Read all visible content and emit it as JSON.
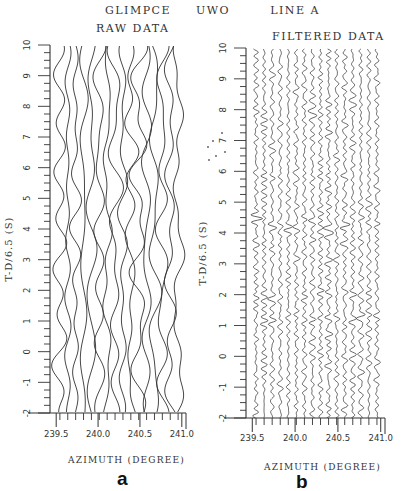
{
  "header": {
    "title_parts": [
      "GLIMPCE",
      "UWO",
      "LINE A"
    ]
  },
  "chart_data": [
    {
      "type": "line",
      "panel": "a",
      "title": "RAW DATA",
      "xlabel": "AZIMUTH (DEGREE)",
      "ylabel": "T-D/6.5 (S)",
      "xlim": [
        239.45,
        241.05
      ],
      "ylim": [
        -2,
        10
      ],
      "x_ticks": [
        239.5,
        240.0,
        240.5,
        241.0
      ],
      "x_tick_labels": [
        "239.5",
        "240.0",
        "240.5",
        "241.0"
      ],
      "y_ticks": [
        -2,
        -1,
        0,
        1,
        2,
        3,
        4,
        5,
        6,
        7,
        8,
        9,
        10
      ],
      "y_tick_labels": [
        "-2",
        "-1",
        "0",
        "1",
        "2",
        "3",
        "4",
        "5",
        "6",
        "7",
        "8",
        "9",
        "10"
      ],
      "y_minor_step": 0.25,
      "grid": false,
      "trace_count": 16,
      "trace_character": "low-frequency wavy seismic traces, large lateral swings, no coherent arrivals"
    },
    {
      "type": "line",
      "panel": "b",
      "title": "FILTERED DATA",
      "xlabel": "AZIMUTH (DEGREE)",
      "ylabel": "T-D/6.5 (S)",
      "xlim": [
        239.45,
        241.05
      ],
      "ylim": [
        -2,
        10
      ],
      "x_ticks": [
        239.5,
        240.0,
        240.5,
        241.0
      ],
      "x_tick_labels": [
        "239.5",
        "240.0",
        "240.5",
        "241.0"
      ],
      "y_ticks": [
        -2,
        -1,
        0,
        1,
        2,
        3,
        4,
        5,
        6,
        7,
        8,
        9,
        10
      ],
      "y_tick_labels": [
        "-2",
        "-1",
        "0",
        "1",
        "2",
        "3",
        "4",
        "5",
        "6",
        "7",
        "8",
        "9",
        "10"
      ],
      "y_minor_step": 0.25,
      "grid": false,
      "trace_count": 16,
      "trace_character": "high-frequency filtered traces with coherent arrivals",
      "annotations": [
        {
          "label": "strong coherent arrival",
          "t": 4.3
        },
        {
          "label": "arrival",
          "t": 3.8
        },
        {
          "label": "arrival",
          "t": 1.2
        },
        {
          "label": "arrival",
          "t": 2.0
        },
        {
          "label": "arrival",
          "t": 6.0
        }
      ]
    }
  ],
  "panels": {
    "a": {
      "title": "RAW DATA",
      "letter": "a",
      "xlabel": "AZIMUTH  (DEGREE)",
      "ylabel": "T-D/6.5  (S)"
    },
    "b": {
      "title": "FILTERED DATA",
      "letter": "b",
      "xlabel": "AZIMUTH  (DEGREE)",
      "ylabel": "T-D/6.5  (S)"
    }
  },
  "colors": {
    "ink": "#333333",
    "background": "#ffffff"
  }
}
